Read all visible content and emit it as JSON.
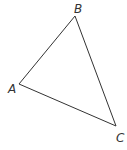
{
  "diagram": {
    "type": "triangle",
    "stroke_color": "#333333",
    "vertices": [
      {
        "label": "A",
        "x": 19,
        "y": 84
      },
      {
        "label": "B",
        "x": 75,
        "y": 16
      },
      {
        "label": "C",
        "x": 116,
        "y": 126
      }
    ],
    "labels": {
      "A": "A",
      "B": "B",
      "C": "C"
    }
  }
}
